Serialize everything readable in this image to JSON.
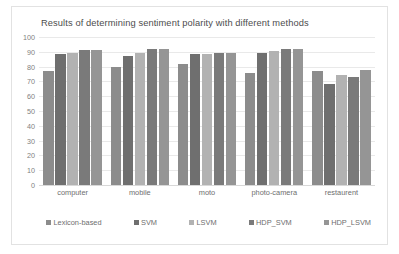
{
  "chart_data": {
    "type": "bar",
    "title": "Results of determining sentiment polarity with different methods",
    "xlabel": "",
    "ylabel": "",
    "ylim": [
      0,
      100
    ],
    "yticks": [
      100,
      90,
      80,
      70,
      60,
      50,
      40,
      30,
      20,
      10,
      0
    ],
    "grid": true,
    "legend_position": "bottom",
    "categories": [
      "computer",
      "mobile",
      "moto",
      "photo-camera",
      "restaurent"
    ],
    "series": [
      {
        "name": "Lexicon-based",
        "color": "#8c8c8c",
        "values": [
          77,
          80,
          81.5,
          76,
          77
        ]
      },
      {
        "name": "SVM",
        "color": "#6f6f6f",
        "values": [
          88.5,
          87.5,
          88.5,
          89.5,
          68
        ]
      },
      {
        "name": "LSVM",
        "color": "#b2b2b2",
        "values": [
          89,
          89,
          88.5,
          90.5,
          74
        ]
      },
      {
        "name": "HDP_SVM",
        "color": "#7a7a7a",
        "values": [
          91.5,
          92,
          89.5,
          92,
          73
        ]
      },
      {
        "name": "HDP_LSVM",
        "color": "#959595",
        "values": [
          91.5,
          92,
          89,
          92,
          77.5
        ]
      }
    ]
  },
  "colors": {
    "card_background": "#ffffff",
    "card_border": "#e2e2e2",
    "gridline": "#e9e9e9",
    "axis_text": "#7f7f7f",
    "label_text": "#6e6e6e",
    "title_text": "#4d4d4d"
  }
}
